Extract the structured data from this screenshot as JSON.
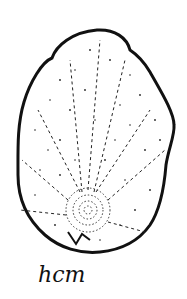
{
  "illustration": {
    "subject": "stippled shell sketch",
    "outline_color": "#111111",
    "background_color": "#ffffff"
  },
  "label": {
    "text": "hcm"
  }
}
